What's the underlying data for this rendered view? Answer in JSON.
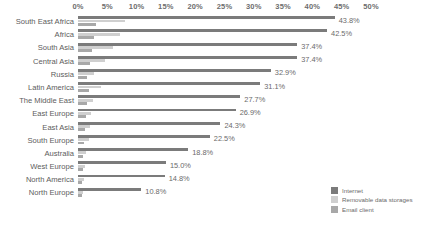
{
  "chart_data": {
    "type": "bar",
    "orientation": "horizontal",
    "title": "",
    "subtitle": "",
    "xlabel": "",
    "ylabel": "",
    "xlim": [
      0,
      50
    ],
    "grid": false,
    "legend_position": "bottom-right",
    "axis_ticks": [
      "0%",
      "5%",
      "10%",
      "15%",
      "20%",
      "25%",
      "30%",
      "35%",
      "40%",
      "45%",
      "50%"
    ],
    "axis_tick_values": [
      0,
      5,
      10,
      15,
      20,
      25,
      30,
      35,
      40,
      45,
      50
    ],
    "categories": [
      "South East Africa",
      "Africa",
      "South Asia",
      "Central Asia",
      "Russia",
      "Latin America",
      "The Middle East",
      "East Europe",
      "East Asia",
      "South Europe",
      "Australia",
      "West Europe",
      "North America",
      "North Europe"
    ],
    "series": [
      {
        "name": "Internet",
        "color": "#7b7b7b",
        "values": [
          43.8,
          42.5,
          37.4,
          37.4,
          32.9,
          31.1,
          27.7,
          26.9,
          24.3,
          22.5,
          18.8,
          15.0,
          14.8,
          10.8
        ],
        "labels": [
          "43.8%",
          "42.5%",
          "37.4%",
          "37.4%",
          "32.9%",
          "31.1%",
          "27.7%",
          "26.9%",
          "24.3%",
          "22.5%",
          "18.8%",
          "15.0%",
          "14.8%",
          "10.8%"
        ]
      },
      {
        "name": "Removable data storages",
        "color": "#cfcfcf",
        "values": [
          8.1,
          7.2,
          6.0,
          4.6,
          2.8,
          3.9,
          2.6,
          2.3,
          2.0,
          1.8,
          1.4,
          1.2,
          1.1,
          0.9
        ]
      },
      {
        "name": "Email client",
        "color": "#a8a8a8",
        "values": [
          3.0,
          2.8,
          2.4,
          2.1,
          1.6,
          1.8,
          1.5,
          1.3,
          1.2,
          1.1,
          0.9,
          0.8,
          0.7,
          0.6
        ]
      }
    ],
    "legend": [
      {
        "label": "Internet",
        "color": "#7b7b7b"
      },
      {
        "label": "Removable data storages",
        "color": "#cfcfcf"
      },
      {
        "label": "Email client",
        "color": "#a8a8a8"
      }
    ]
  }
}
